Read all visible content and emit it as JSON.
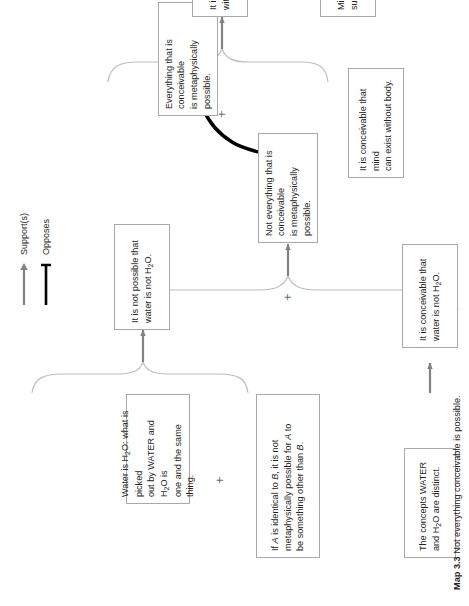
{
  "map": {
    "caption_label": "Map 3.3",
    "caption_text": "Not everything conceivable is possible.",
    "plus_symbol": "+",
    "boxes": {
      "concepts_distinct": "The concepts WATER and H₂O are distinct.",
      "conceivable_water_not_h2o": "It is conceivable that water is not H₂O.",
      "water_is_h2o": "Water is H₂O: what is picked out by WATER and H₂O is one and the same thing.",
      "identity_necessity": "If A is identical to B, it is not metaphysically possible for A to be something other than B.",
      "not_possible_water_not_h2o": "It is not possible that water is not H₂O.",
      "not_everything_conceivable": "Not everything that is conceivable is metaphysically possible.",
      "everything_conceivable": "Everything that is conceivable is metaphysically possible.",
      "conceivable_mind_without_body": "It is conceivable that mind can exist without body.",
      "possible_mind_without_body": "It is possible that mind can exist without body.",
      "mind_body_distinct": "Mind and body are distinct substances."
    }
  },
  "legend": {
    "supports_label": "Support(s)",
    "opposes_label": "Opposes"
  },
  "colors": {
    "box_border": "#a7a9ac",
    "text": "#231f20",
    "supports_arrow": "#808285",
    "opposes_line": "#000000",
    "brace": "#bcbec0"
  }
}
